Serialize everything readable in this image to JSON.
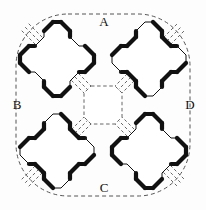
{
  "figure": {
    "type": "technical-diagram",
    "background_color": "#fdfdfd",
    "stroke_color": "#111111",
    "dashed_color": "#555555",
    "thick_stroke_width": 4.2,
    "thin_stroke_width": 1.0,
    "dash_stroke_width": 0.9,
    "dash_pattern": "3,2.4",
    "boundary": {
      "name": "outer-dashed-squircle",
      "x": 16,
      "y": 14,
      "width": 174,
      "height": 182,
      "corner_radius": 52
    },
    "center_void": {
      "name": "central-octagonal-void",
      "cx": 103,
      "cy": 105,
      "half": 19,
      "chamfer": 7
    },
    "labels": [
      {
        "id": "A",
        "text": "A",
        "x": 104,
        "y": 23,
        "position": "top"
      },
      {
        "id": "B",
        "text": "B",
        "x": 17,
        "y": 106,
        "position": "left"
      },
      {
        "id": "C",
        "text": "C",
        "x": 104,
        "y": 189,
        "position": "bottom"
      },
      {
        "id": "D",
        "text": "D",
        "x": 190,
        "y": 106,
        "position": "right"
      }
    ],
    "crosses": [
      {
        "id": "cross-top-left",
        "cx": 57,
        "cy": 59,
        "diagonal": "nw-se",
        "arm": 37,
        "neck": 13,
        "chamfer": 9
      },
      {
        "id": "cross-top-right",
        "cx": 149,
        "cy": 59,
        "diagonal": "ne-sw",
        "arm": 37,
        "neck": 13,
        "chamfer": 9
      },
      {
        "id": "cross-bottom-left",
        "cx": 57,
        "cy": 151,
        "diagonal": "ne-sw",
        "arm": 37,
        "neck": 13,
        "chamfer": 9
      },
      {
        "id": "cross-bottom-right",
        "cx": 149,
        "cy": 151,
        "diagonal": "nw-se",
        "arm": 37,
        "neck": 13,
        "chamfer": 9
      }
    ],
    "diagonal_line_count_per_cross": 3
  }
}
